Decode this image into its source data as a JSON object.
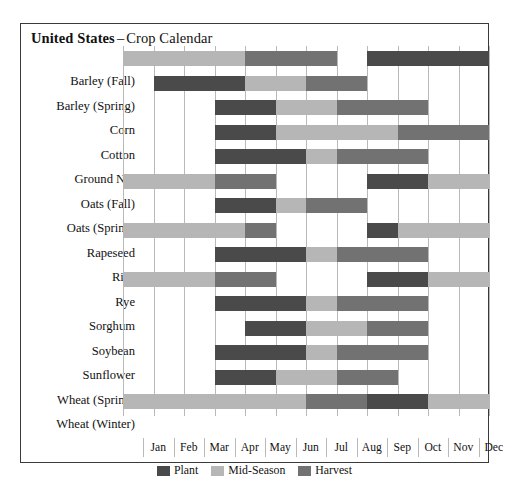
{
  "title": {
    "country": "United States",
    "dash": "–",
    "subtitle": "Crop Calendar"
  },
  "legend": {
    "items": [
      {
        "key": "plant",
        "label": "Plant",
        "color": "#4a4a4a"
      },
      {
        "key": "mid",
        "label": "Mid-Season",
        "color": "#b6b6b6"
      },
      {
        "key": "harvest",
        "label": "Harvest",
        "color": "#727272"
      }
    ]
  },
  "chart_data": {
    "type": "bar",
    "xlabel": "",
    "ylabel": "",
    "grid": true,
    "legend_position": "bottom-center",
    "x": [
      "Jan",
      "Feb",
      "Mar",
      "Apr",
      "May",
      "Jun",
      "Jul",
      "Aug",
      "Sep",
      "Oct",
      "Nov",
      "Dec"
    ],
    "xlim": [
      0,
      12
    ],
    "stage_colors": {
      "plant": "#4a4a4a",
      "mid": "#b6b6b6",
      "harvest": "#727272"
    },
    "categories": [
      "Barley (Fall)",
      "Barley (Spring)",
      "Corn",
      "Cotton",
      "Ground Nut",
      "Oats (Fall)",
      "Oats (Spring)",
      "Rapeseed",
      "Rice",
      "Rye",
      "Sorghum",
      "Soybean",
      "Sunflower",
      "Wheat (Spring)",
      "Wheat (Winter)"
    ],
    "rows": [
      {
        "crop": "Barley (Fall)",
        "segments": [
          {
            "stage": "mid",
            "start": 0,
            "end": 4
          },
          {
            "stage": "harvest",
            "start": 4,
            "end": 7
          },
          {
            "stage": "plant",
            "start": 8,
            "end": 12
          }
        ]
      },
      {
        "crop": "Barley (Spring)",
        "segments": [
          {
            "stage": "plant",
            "start": 1,
            "end": 4
          },
          {
            "stage": "mid",
            "start": 4,
            "end": 6
          },
          {
            "stage": "harvest",
            "start": 6,
            "end": 8
          }
        ]
      },
      {
        "crop": "Corn",
        "segments": [
          {
            "stage": "plant",
            "start": 3,
            "end": 5
          },
          {
            "stage": "mid",
            "start": 5,
            "end": 7
          },
          {
            "stage": "harvest",
            "start": 7,
            "end": 10
          }
        ]
      },
      {
        "crop": "Cotton",
        "segments": [
          {
            "stage": "plant",
            "start": 3,
            "end": 5
          },
          {
            "stage": "mid",
            "start": 5,
            "end": 9
          },
          {
            "stage": "harvest",
            "start": 9,
            "end": 12
          }
        ]
      },
      {
        "crop": "Ground Nut",
        "segments": [
          {
            "stage": "plant",
            "start": 3,
            "end": 6
          },
          {
            "stage": "mid",
            "start": 6,
            "end": 7
          },
          {
            "stage": "harvest",
            "start": 7,
            "end": 10
          }
        ]
      },
      {
        "crop": "Oats (Fall)",
        "segments": [
          {
            "stage": "mid",
            "start": 0,
            "end": 3
          },
          {
            "stage": "harvest",
            "start": 3,
            "end": 5
          },
          {
            "stage": "plant",
            "start": 8,
            "end": 10
          },
          {
            "stage": "mid",
            "start": 10,
            "end": 12
          }
        ]
      },
      {
        "crop": "Oats (Spring)",
        "segments": [
          {
            "stage": "plant",
            "start": 3,
            "end": 5
          },
          {
            "stage": "mid",
            "start": 5,
            "end": 6
          },
          {
            "stage": "harvest",
            "start": 6,
            "end": 8
          }
        ]
      },
      {
        "crop": "Rapeseed",
        "segments": [
          {
            "stage": "mid",
            "start": 0,
            "end": 4
          },
          {
            "stage": "harvest",
            "start": 4,
            "end": 5
          },
          {
            "stage": "plant",
            "start": 8,
            "end": 9
          },
          {
            "stage": "mid",
            "start": 9,
            "end": 12
          }
        ]
      },
      {
        "crop": "Rice",
        "segments": [
          {
            "stage": "plant",
            "start": 3,
            "end": 6
          },
          {
            "stage": "mid",
            "start": 6,
            "end": 7
          },
          {
            "stage": "harvest",
            "start": 7,
            "end": 10
          }
        ]
      },
      {
        "crop": "Rye",
        "segments": [
          {
            "stage": "mid",
            "start": 0,
            "end": 3
          },
          {
            "stage": "harvest",
            "start": 3,
            "end": 5
          },
          {
            "stage": "plant",
            "start": 8,
            "end": 10
          },
          {
            "stage": "mid",
            "start": 10,
            "end": 12
          }
        ]
      },
      {
        "crop": "Sorghum",
        "segments": [
          {
            "stage": "plant",
            "start": 3,
            "end": 6
          },
          {
            "stage": "mid",
            "start": 6,
            "end": 7
          },
          {
            "stage": "harvest",
            "start": 7,
            "end": 10
          }
        ]
      },
      {
        "crop": "Soybean",
        "segments": [
          {
            "stage": "plant",
            "start": 4,
            "end": 6
          },
          {
            "stage": "mid",
            "start": 6,
            "end": 8
          },
          {
            "stage": "harvest",
            "start": 8,
            "end": 10
          }
        ]
      },
      {
        "crop": "Sunflower",
        "segments": [
          {
            "stage": "plant",
            "start": 3,
            "end": 6
          },
          {
            "stage": "mid",
            "start": 6,
            "end": 7
          },
          {
            "stage": "harvest",
            "start": 7,
            "end": 10
          }
        ]
      },
      {
        "crop": "Wheat (Spring)",
        "segments": [
          {
            "stage": "plant",
            "start": 3,
            "end": 5
          },
          {
            "stage": "mid",
            "start": 5,
            "end": 7
          },
          {
            "stage": "harvest",
            "start": 7,
            "end": 9
          }
        ]
      },
      {
        "crop": "Wheat (Winter)",
        "segments": [
          {
            "stage": "mid",
            "start": 0,
            "end": 6
          },
          {
            "stage": "harvest",
            "start": 6,
            "end": 8
          },
          {
            "stage": "plant",
            "start": 8,
            "end": 10
          },
          {
            "stage": "mid",
            "start": 10,
            "end": 12
          }
        ]
      }
    ]
  }
}
